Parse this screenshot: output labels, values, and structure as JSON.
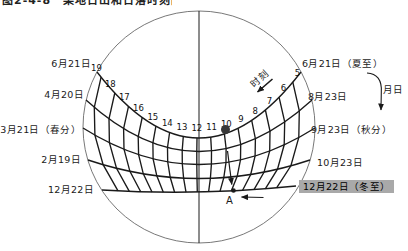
{
  "title": {
    "clipped_text": "图2-4-8　某地日出和日落时刻图"
  },
  "chart": {
    "hours": [
      "19",
      "18",
      "17",
      "16",
      "15",
      "14",
      "13",
      "12",
      "11",
      "10",
      "9",
      "8",
      "7",
      "6",
      "5"
    ],
    "left_dates": [
      "6月21日",
      "4月20日",
      "3月21日（春分）",
      "2月19日",
      "12月22日"
    ],
    "right_dates": [
      "6月21日（夏至）",
      "8月23日",
      "9月23日（秋分）",
      "10月23日",
      "12月22日（冬至）"
    ],
    "axis_time_label": "时刻",
    "axis_date_label": "月日",
    "point_a_label": "A",
    "colors": {
      "line": "#1a1a1a",
      "circle_outline": "#555555",
      "highlight_bg": "#a9a9a9",
      "sun_dot": "#383838"
    }
  }
}
